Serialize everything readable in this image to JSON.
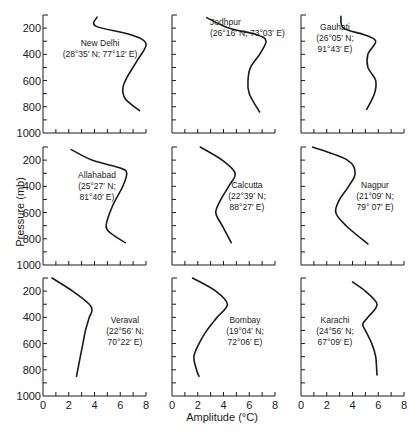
{
  "chart_data": {
    "type": "line",
    "layout": "3x3 small multiples",
    "xlabel": "Amplitude (°C)",
    "ylabel": "Pressure (mb)",
    "xlim": [
      0,
      8
    ],
    "ylim": [
      1000,
      100
    ],
    "x_ticks": [
      0,
      2,
      4,
      6,
      8
    ],
    "y_ticks": [
      200,
      400,
      600,
      800,
      1000
    ],
    "grid": false,
    "legend": null,
    "panels": [
      {
        "name": "New Delhi",
        "coords": [
          "(28°35′ N; 77°12′ E)"
        ],
        "label_lines": [
          "New Delhi",
          "(28°35′  N; 77°12′  E)"
        ],
        "pressure": [
          115,
          185,
          250,
          320,
          450,
          580,
          660,
          740,
          830
        ],
        "amplitude": [
          4.2,
          4.1,
          6.8,
          8.0,
          7.3,
          6.5,
          6.2,
          6.4,
          7.5
        ]
      },
      {
        "name": "Jodhpur",
        "label_lines": [
          "Jodhpur",
          "(26°16′  N; 73°03′  E)"
        ],
        "pressure": [
          120,
          200,
          250,
          300,
          400,
          500,
          600,
          700,
          840
        ],
        "amplitude": [
          2.7,
          4.4,
          6.6,
          7.3,
          6.8,
          6.1,
          5.9,
          6.0,
          6.8
        ]
      },
      {
        "name": "Gauhati",
        "label_lines": [
          "Gauhati",
          "(26°05′  N;",
          "91°43′  E)"
        ],
        "pressure": [
          110,
          200,
          250,
          300,
          400,
          500,
          600,
          700,
          820
        ],
        "amplitude": [
          3.1,
          3.3,
          4.9,
          5.8,
          5.2,
          5.2,
          5.8,
          5.7,
          5.1
        ]
      },
      {
        "name": "Allahabad",
        "label_lines": [
          "Allahabad",
          "(25°27′  N;",
          "81°40′  E)"
        ],
        "pressure": [
          120,
          200,
          260,
          300,
          400,
          550,
          700,
          760,
          830
        ],
        "amplitude": [
          2.2,
          3.8,
          6.0,
          6.5,
          6.2,
          5.4,
          4.9,
          5.3,
          6.4
        ]
      },
      {
        "name": "Calcutta",
        "label_lines": [
          "Calcutta",
          "(22°39′  N;",
          "88°27′  E)"
        ],
        "pressure": [
          100,
          200,
          300,
          400,
          500,
          600,
          700,
          830
        ],
        "amplitude": [
          2.2,
          3.9,
          4.9,
          4.4,
          3.8,
          3.4,
          3.9,
          4.6
        ]
      },
      {
        "name": "Nagpur",
        "label_lines": [
          "Nagpur",
          "(21°09′  N;",
          "79° 07′  E)"
        ],
        "pressure": [
          100,
          200,
          300,
          400,
          500,
          600,
          700,
          840
        ],
        "amplitude": [
          0.9,
          3.6,
          4.2,
          3.7,
          3.0,
          2.7,
          3.5,
          5.2
        ]
      },
      {
        "name": "Veraval",
        "label_lines": [
          "Veraval",
          "(22°56′  N;",
          "70°22′  E)"
        ],
        "pressure": [
          100,
          200,
          300,
          350,
          400,
          500,
          600,
          700,
          850
        ],
        "amplitude": [
          0.7,
          2.3,
          3.6,
          3.8,
          3.6,
          3.3,
          3.1,
          2.9,
          2.6
        ]
      },
      {
        "name": "Bombay",
        "label_lines": [
          "Bombay",
          "(19°04′  N;",
          "72°06′  E)"
        ],
        "pressure": [
          100,
          200,
          300,
          400,
          500,
          600,
          700,
          800,
          850
        ],
        "amplitude": [
          1.6,
          3.4,
          4.3,
          3.5,
          2.7,
          2.1,
          1.7,
          1.9,
          2.1
        ]
      },
      {
        "name": "Karachi",
        "label_lines": [
          "Karachi",
          "(24°56′  N;",
          "67°09′  E)"
        ],
        "pressure": [
          130,
          200,
          300,
          400,
          450,
          500,
          600,
          700,
          840
        ],
        "amplitude": [
          4.0,
          5.0,
          5.9,
          5.2,
          4.8,
          5.0,
          5.5,
          5.8,
          5.9
        ]
      }
    ]
  }
}
